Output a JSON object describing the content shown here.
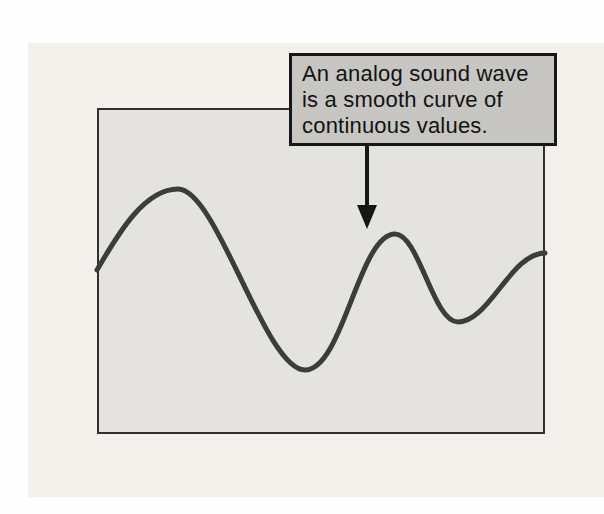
{
  "figure": {
    "panel": {
      "bg": "#f4f1ec"
    },
    "frame": {
      "bg": "#e4e3df",
      "border": "#2f2f2f"
    },
    "callout": {
      "bg": "#c7c6c3",
      "border": "#161616",
      "lines": {
        "0": "An analog sound wave",
        "1": "is a smooth curve of",
        "2": "continuous values."
      }
    },
    "arrow": {
      "color": "#161616",
      "direction": "down"
    },
    "wave": {
      "color": "#3c3c3c",
      "stroke_width": 5,
      "path_d": "M 0 162 C 22 124 48 81 81 81 C 120 81 168 262 208 262 C 246 262 262 126 298 126 C 322 126 336 214 361 214 C 392 214 414 145 448 145",
      "keypoints": [
        {
          "x": 0,
          "y": 162,
          "type": "start"
        },
        {
          "x": 81,
          "y": 81,
          "type": "crest"
        },
        {
          "x": 208,
          "y": 262,
          "type": "trough"
        },
        {
          "x": 298,
          "y": 126,
          "type": "crest"
        },
        {
          "x": 361,
          "y": 214,
          "type": "dip"
        },
        {
          "x": 448,
          "y": 145,
          "type": "end"
        }
      ]
    }
  }
}
